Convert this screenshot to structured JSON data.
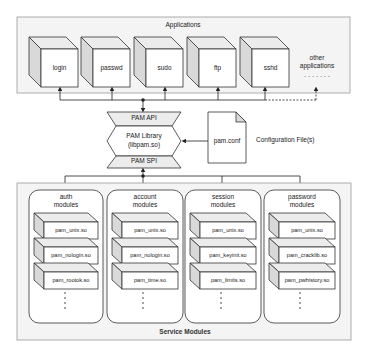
{
  "diagram": {
    "applications": {
      "title": "Applications",
      "items": [
        {
          "label": "login"
        },
        {
          "label": "passwd"
        },
        {
          "label": "sudo"
        },
        {
          "label": "ftp"
        },
        {
          "label": "sshd"
        }
      ],
      "other_label_line1": "other",
      "other_label_line2": "applications",
      "other_ellipsis": "· · · · · · ·"
    },
    "pam": {
      "api_label": "PAM API",
      "library_line1": "PAM Library",
      "library_line2": "(libpam.so)",
      "spi_label": "PAM SPI"
    },
    "config": {
      "file_label": "pam.conf",
      "caption": "Configuration File(s)"
    },
    "service_modules": {
      "title": "Service Modules",
      "groups": [
        {
          "title_line1": "auth",
          "title_line2": "modules",
          "modules": [
            "pam_unix.so",
            "pam_nologin.so",
            "pam_rootok.so"
          ]
        },
        {
          "title_line1": "account",
          "title_line2": "modules",
          "modules": [
            "pam_unix.so",
            "pam_nologin.so",
            "pam_time.so"
          ]
        },
        {
          "title_line1": "session",
          "title_line2": "modules",
          "modules": [
            "pam_unix.so",
            "pam_keyinit.so",
            "pam_limits.so"
          ]
        },
        {
          "title_line1": "password",
          "title_line2": "modules",
          "modules": [
            "pam_unix.so",
            "pam_cracklib.so",
            "pam_pwhistory.so"
          ]
        }
      ]
    },
    "colors": {
      "container_fill": "#f4f4f4",
      "panel_fill": "#ffffff",
      "side_face": "#d9d9d9",
      "top_face": "#ececec",
      "stroke": "#333333"
    }
  }
}
